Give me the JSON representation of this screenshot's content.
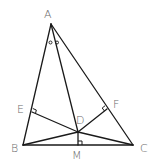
{
  "diagram": {
    "type": "geometry-triangle",
    "points": {
      "A": {
        "label": "A",
        "x": 51,
        "y": 24
      },
      "B": {
        "label": "B",
        "x": 23,
        "y": 145
      },
      "C": {
        "label": "C",
        "x": 133,
        "y": 145
      },
      "D": {
        "label": "D",
        "x": 78,
        "y": 132
      },
      "E": {
        "label": "E",
        "x": 32,
        "y": 112
      },
      "F": {
        "label": "F",
        "x": 107,
        "y": 109
      },
      "M": {
        "label": "M",
        "x": 78,
        "y": 145
      }
    },
    "segments": [
      [
        "A",
        "B"
      ],
      [
        "A",
        "C"
      ],
      [
        "B",
        "C"
      ],
      [
        "A",
        "D"
      ],
      [
        "D",
        "E"
      ],
      [
        "D",
        "F"
      ],
      [
        "D",
        "M"
      ],
      [
        "B",
        "D"
      ],
      [
        "C",
        "D"
      ]
    ],
    "right_angles": [
      "E",
      "F",
      "M"
    ],
    "equal_angle_marks": {
      "vertex": "A",
      "mark": "o",
      "count": 2
    },
    "colors": {
      "line": "#1a1a1a",
      "label": "#6b6b6b",
      "background": "#ffffff"
    }
  }
}
